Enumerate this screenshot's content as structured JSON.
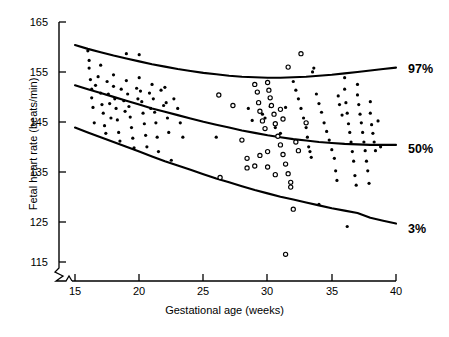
{
  "figure": {
    "title_fragment": "",
    "background_color": "#ffffff",
    "ink_color": "#000000"
  },
  "axes": {
    "y": {
      "title": "Fetal heart rate (beats/min)",
      "ticks": [
        115,
        125,
        135,
        145,
        155,
        165
      ],
      "min": 115,
      "max": 165,
      "has_axis_break": true
    },
    "x": {
      "title": "Gestational age (weeks)",
      "ticks": [
        15,
        20,
        25,
        30,
        35,
        40
      ],
      "min": 15,
      "max": 40,
      "has_axis_break": true
    }
  },
  "annotations": [
    {
      "name": "percentile-97",
      "label": "97%"
    },
    {
      "name": "percentile-50",
      "label": "50%"
    },
    {
      "name": "percentile-3",
      "label": "3%"
    }
  ],
  "chart_data": {
    "type": "scatter",
    "title": "",
    "xlabel": "Gestational age (weeks)",
    "ylabel": "Fetal heart rate (beats/min)",
    "xlim": [
      15,
      40
    ],
    "ylim": [
      115,
      165
    ],
    "grid": false,
    "legend": "none",
    "xticks": [
      15,
      20,
      25,
      30,
      35,
      40
    ],
    "yticks": [
      115,
      125,
      135,
      145,
      155,
      165
    ],
    "curves": [
      {
        "name": "97th percentile",
        "label": "97%",
        "style": "solid",
        "points": [
          [
            15.0,
            160.2
          ],
          [
            16.0,
            159.4
          ],
          [
            17.0,
            158.7
          ],
          [
            18.0,
            158.0
          ],
          [
            19.0,
            157.4
          ],
          [
            20.0,
            156.8
          ],
          [
            21.0,
            156.2
          ],
          [
            22.0,
            155.7
          ],
          [
            23.0,
            155.2
          ],
          [
            24.0,
            154.8
          ],
          [
            25.0,
            154.4
          ],
          [
            26.0,
            154.1
          ],
          [
            27.0,
            153.8
          ],
          [
            28.0,
            153.6
          ],
          [
            29.0,
            153.5
          ],
          [
            30.0,
            153.4
          ],
          [
            31.0,
            153.4
          ],
          [
            32.0,
            153.5
          ],
          [
            33.0,
            153.6
          ],
          [
            34.0,
            153.8
          ],
          [
            35.0,
            154.0
          ],
          [
            36.0,
            154.3
          ],
          [
            37.0,
            154.6
          ],
          [
            38.0,
            154.9
          ],
          [
            39.0,
            155.2
          ],
          [
            40.0,
            155.5
          ]
        ]
      },
      {
        "name": "50th percentile",
        "label": "50%",
        "style": "solid",
        "points": [
          [
            15.0,
            151.8
          ],
          [
            16.0,
            151.0
          ],
          [
            17.0,
            150.2
          ],
          [
            18.0,
            149.4
          ],
          [
            19.0,
            148.6
          ],
          [
            20.0,
            147.8
          ],
          [
            21.0,
            147.0
          ],
          [
            22.0,
            146.3
          ],
          [
            23.0,
            145.6
          ],
          [
            24.0,
            144.9
          ],
          [
            25.0,
            144.2
          ],
          [
            26.0,
            143.6
          ],
          [
            27.0,
            143.0
          ],
          [
            28.0,
            142.4
          ],
          [
            29.0,
            141.9
          ],
          [
            30.0,
            141.4
          ],
          [
            31.0,
            141.0
          ],
          [
            32.0,
            140.6
          ],
          [
            33.0,
            140.3
          ],
          [
            34.0,
            140.0
          ],
          [
            35.0,
            139.8
          ],
          [
            36.0,
            139.6
          ],
          [
            37.0,
            139.5
          ],
          [
            38.0,
            139.4
          ],
          [
            39.0,
            139.4
          ],
          [
            40.0,
            139.4
          ]
        ]
      },
      {
        "name": "3rd percentile",
        "label": "3%",
        "style": "solid",
        "points": [
          [
            15.0,
            143.0
          ],
          [
            16.0,
            142.0
          ],
          [
            17.0,
            141.0
          ],
          [
            18.0,
            140.0
          ],
          [
            19.0,
            139.0
          ],
          [
            20.0,
            138.0
          ],
          [
            21.0,
            137.0
          ],
          [
            22.0,
            136.0
          ],
          [
            23.0,
            135.1
          ],
          [
            24.0,
            134.2
          ],
          [
            25.0,
            133.3
          ],
          [
            26.0,
            132.4
          ],
          [
            27.0,
            131.6
          ],
          [
            28.0,
            130.8
          ],
          [
            29.0,
            130.0
          ],
          [
            30.0,
            129.3
          ],
          [
            31.0,
            128.6
          ],
          [
            32.0,
            128.0
          ],
          [
            33.0,
            127.4
          ],
          [
            34.0,
            126.8
          ],
          [
            35.0,
            126.2
          ],
          [
            36.0,
            125.7
          ],
          [
            37.0,
            125.2
          ],
          [
            38.0,
            124.2
          ],
          [
            39.0,
            123.6
          ],
          [
            40.0,
            123.0
          ]
        ]
      }
    ],
    "series": [
      {
        "name": "filled-observations",
        "marker": "filled-circle",
        "marker_size_px": 3.2,
        "points": [
          [
            16.0,
            159.0
          ],
          [
            16.1,
            157.0
          ],
          [
            16.1,
            155.4
          ],
          [
            16.2,
            153.0
          ],
          [
            16.3,
            151.0
          ],
          [
            16.3,
            149.2
          ],
          [
            16.4,
            147.2
          ],
          [
            16.5,
            144.0
          ],
          [
            16.6,
            151.8
          ],
          [
            16.8,
            153.6
          ],
          [
            17.0,
            156.0
          ],
          [
            17.0,
            150.2
          ],
          [
            17.1,
            147.8
          ],
          [
            17.2,
            146.0
          ],
          [
            17.3,
            143.4
          ],
          [
            17.4,
            141.8
          ],
          [
            17.5,
            152.6
          ],
          [
            17.6,
            150.0
          ],
          [
            17.7,
            148.0
          ],
          [
            17.8,
            145.0
          ],
          [
            18.0,
            154.0
          ],
          [
            18.0,
            151.6
          ],
          [
            18.1,
            149.0
          ],
          [
            18.2,
            147.0
          ],
          [
            18.3,
            144.6
          ],
          [
            18.4,
            142.0
          ],
          [
            18.5,
            140.2
          ],
          [
            18.6,
            151.0
          ],
          [
            18.8,
            148.6
          ],
          [
            18.9,
            146.4
          ],
          [
            19.0,
            158.4
          ],
          [
            19.0,
            152.8
          ],
          [
            19.1,
            150.0
          ],
          [
            19.2,
            147.4
          ],
          [
            19.3,
            145.2
          ],
          [
            19.4,
            143.0
          ],
          [
            19.5,
            140.8
          ],
          [
            19.6,
            138.8
          ],
          [
            19.8,
            151.2
          ],
          [
            19.9,
            149.0
          ],
          [
            20.0,
            158.2
          ],
          [
            20.0,
            153.4
          ],
          [
            20.1,
            150.6
          ],
          [
            20.2,
            148.4
          ],
          [
            20.3,
            146.0
          ],
          [
            20.4,
            143.8
          ],
          [
            20.5,
            141.4
          ],
          [
            20.6,
            139.0
          ],
          [
            20.8,
            150.2
          ],
          [
            20.9,
            147.0
          ],
          [
            21.0,
            152.0
          ],
          [
            21.1,
            149.0
          ],
          [
            21.2,
            146.2
          ],
          [
            21.3,
            144.0
          ],
          [
            21.4,
            141.0
          ],
          [
            21.5,
            138.0
          ],
          [
            21.7,
            150.8
          ],
          [
            21.9,
            147.6
          ],
          [
            22.0,
            151.4
          ],
          [
            22.1,
            148.2
          ],
          [
            22.2,
            145.0
          ],
          [
            22.3,
            142.0
          ],
          [
            22.5,
            136.2
          ],
          [
            22.7,
            149.0
          ],
          [
            23.0,
            147.0
          ],
          [
            23.2,
            144.0
          ],
          [
            23.4,
            141.0
          ],
          [
            26.0,
            141.0
          ],
          [
            28.5,
            147.0
          ],
          [
            28.8,
            144.5
          ],
          [
            29.6,
            145.8
          ],
          [
            29.8,
            145.0
          ],
          [
            30.2,
            147.4
          ],
          [
            30.6,
            143.0
          ],
          [
            30.8,
            141.2
          ],
          [
            31.0,
            141.8
          ],
          [
            31.4,
            147.2
          ],
          [
            32.0,
            152.6
          ],
          [
            32.2,
            150.8
          ],
          [
            32.4,
            149.0
          ],
          [
            32.6,
            147.0
          ],
          [
            32.8,
            145.0
          ],
          [
            33.0,
            143.0
          ],
          [
            33.1,
            141.0
          ],
          [
            33.2,
            139.0
          ],
          [
            33.3,
            138.0
          ],
          [
            33.4,
            136.8
          ],
          [
            33.5,
            154.6
          ],
          [
            33.6,
            155.4
          ],
          [
            33.8,
            150.0
          ],
          [
            34.0,
            148.0
          ],
          [
            34.2,
            146.2
          ],
          [
            34.4,
            144.0
          ],
          [
            34.6,
            142.2
          ],
          [
            34.8,
            140.4
          ],
          [
            35.0,
            138.4
          ],
          [
            35.2,
            136.6
          ],
          [
            35.3,
            134.0
          ],
          [
            35.4,
            132.0
          ],
          [
            35.5,
            149.6
          ],
          [
            35.6,
            147.8
          ],
          [
            35.8,
            145.6
          ],
          [
            36.0,
            153.4
          ],
          [
            36.0,
            151.0
          ],
          [
            36.1,
            148.2
          ],
          [
            36.2,
            146.0
          ],
          [
            36.3,
            143.8
          ],
          [
            36.4,
            142.0
          ],
          [
            36.5,
            140.0
          ],
          [
            36.6,
            138.0
          ],
          [
            36.7,
            136.0
          ],
          [
            36.8,
            133.0
          ],
          [
            36.9,
            131.0
          ],
          [
            37.0,
            152.0
          ],
          [
            37.0,
            149.8
          ],
          [
            37.1,
            147.8
          ],
          [
            37.2,
            145.8
          ],
          [
            37.3,
            144.0
          ],
          [
            37.4,
            142.0
          ],
          [
            37.5,
            140.0
          ],
          [
            37.6,
            138.2
          ],
          [
            37.7,
            136.0
          ],
          [
            37.8,
            134.0
          ],
          [
            37.9,
            131.4
          ],
          [
            38.0,
            148.4
          ],
          [
            38.0,
            146.0
          ],
          [
            38.1,
            143.6
          ],
          [
            38.2,
            141.8
          ],
          [
            38.3,
            140.0
          ],
          [
            38.4,
            138.2
          ],
          [
            38.6,
            144.4
          ],
          [
            38.8,
            139.0
          ],
          [
            36.2,
            122.4
          ],
          [
            34.0,
            127.0
          ]
        ]
      },
      {
        "name": "open-observations",
        "marker": "open-circle",
        "marker_size_px": 4.2,
        "points": [
          [
            26.2,
            149.8
          ],
          [
            27.3,
            147.6
          ],
          [
            28.4,
            136.6
          ],
          [
            28.4,
            134.6
          ],
          [
            26.3,
            132.6
          ],
          [
            29.0,
            152.0
          ],
          [
            29.2,
            150.4
          ],
          [
            29.3,
            148.2
          ],
          [
            29.4,
            146.4
          ],
          [
            29.6,
            144.4
          ],
          [
            29.8,
            142.8
          ],
          [
            30.0,
            152.4
          ],
          [
            30.1,
            150.8
          ],
          [
            30.2,
            149.2
          ],
          [
            30.3,
            147.6
          ],
          [
            30.5,
            145.8
          ],
          [
            30.6,
            143.8
          ],
          [
            30.8,
            141.2
          ],
          [
            31.0,
            139.4
          ],
          [
            31.2,
            137.4
          ],
          [
            31.4,
            135.4
          ],
          [
            30.0,
            138.0
          ],
          [
            29.4,
            137.2
          ],
          [
            29.0,
            135.0
          ],
          [
            31.6,
            133.4
          ],
          [
            31.8,
            131.6
          ],
          [
            31.8,
            130.6
          ],
          [
            30.0,
            134.8
          ],
          [
            30.6,
            133.2
          ],
          [
            32.2,
            140.0
          ],
          [
            32.4,
            138.2
          ],
          [
            31.0,
            146.8
          ],
          [
            31.2,
            144.8
          ],
          [
            28.0,
            140.4
          ],
          [
            32.6,
            158.4
          ],
          [
            31.6,
            155.6
          ],
          [
            33.0,
            144.0
          ],
          [
            32.0,
            126.0
          ],
          [
            31.4,
            116.6
          ]
        ]
      }
    ]
  }
}
